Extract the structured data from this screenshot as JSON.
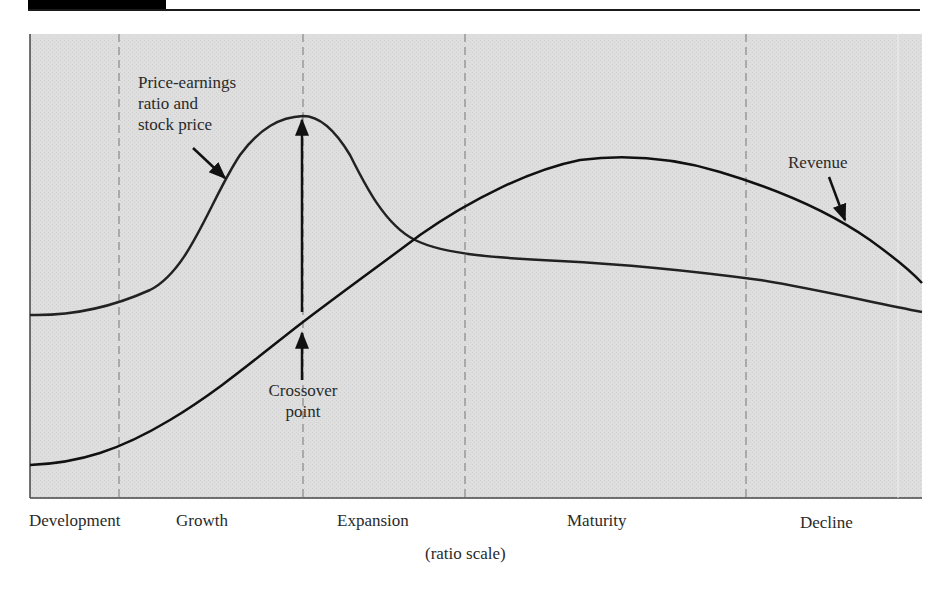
{
  "figure": {
    "type": "diagram",
    "x_axis_note": "(ratio scale)",
    "stages": [
      {
        "label": "Development"
      },
      {
        "label": "Growth"
      },
      {
        "label": "Expansion"
      },
      {
        "label": "Maturity"
      },
      {
        "label": "Decline"
      }
    ],
    "annotations": {
      "pe_line1": "Price-earnings",
      "pe_line2": "ratio and",
      "pe_line3": "stock price",
      "revenue": "Revenue",
      "crossover_line1": "Crossover",
      "crossover_line2": "point"
    },
    "series": [
      {
        "name": "Price-earnings ratio and stock price",
        "shape": "rises sharply during Growth to a peak near the Growth/Expansion boundary, falls through Expansion, levels off in Maturity and declines slowly in Decline"
      },
      {
        "name": "Revenue",
        "shape": "starts low in Development, rises steadily through Growth and Expansion, peaks in mid-Maturity, falls in Decline"
      }
    ],
    "colors": {
      "plot_background": "#dcdcdc",
      "curve": "#111111",
      "divider": "#777777",
      "header_bar": "#000000"
    }
  }
}
